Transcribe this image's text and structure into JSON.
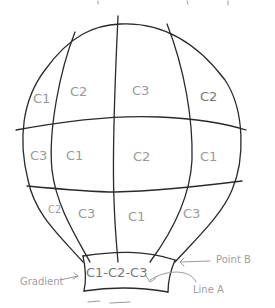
{
  "diagram": {
    "rows": [
      {
        "name": "top",
        "cells": [
          "C1",
          "C2",
          "C3",
          "C2"
        ]
      },
      {
        "name": "middle",
        "cells": [
          "C3",
          "C1",
          "C2",
          "C1"
        ]
      },
      {
        "name": "lower",
        "cells": [
          "C2",
          "C3",
          "C1",
          "C3"
        ]
      }
    ],
    "basket_band": {
      "label": "C1-C2-C3"
    },
    "annotations": {
      "gradient": "Gradient",
      "point_b": "Point B",
      "line_a": "Line A"
    },
    "colors": {
      "ink": "#2a2a2a",
      "pencil": "#9a9a9a",
      "background": "#ffffff"
    }
  }
}
